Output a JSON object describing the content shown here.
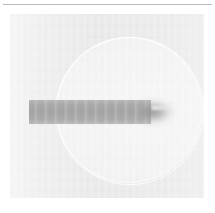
{
  "panel": {
    "kind": "grayscale-radiograph",
    "background_color": "#ffffff",
    "plate_color": "#e9e9e9",
    "plate_left": 10,
    "plate_top": 14,
    "plate_width": 194,
    "plate_height": 184,
    "caption": ""
  },
  "top_rule": {
    "color": "#b9b9b9",
    "left": 3,
    "top": 4,
    "width": 209,
    "thickness": 1
  },
  "disc": {
    "name": "circular-halo",
    "center_x": 129,
    "center_y": 110,
    "diameter": 146,
    "fill_color": "#efefef",
    "edge_color": "#f6f6f6",
    "label": ""
  },
  "bar": {
    "name": "horizontal-specimen-bar",
    "left": 29,
    "top": 100,
    "width": 122,
    "height": 24,
    "fill_color": "#a4a4a4",
    "edge_color": "#b6b6b6",
    "label": ""
  },
  "bar_tip": {
    "name": "blurred-tapered-tip",
    "left": 143,
    "top": 96,
    "width": 46,
    "height": 32,
    "core_color": "#8c8c8c",
    "label": ""
  },
  "annotations": {
    "text_items": [],
    "note": ""
  }
}
